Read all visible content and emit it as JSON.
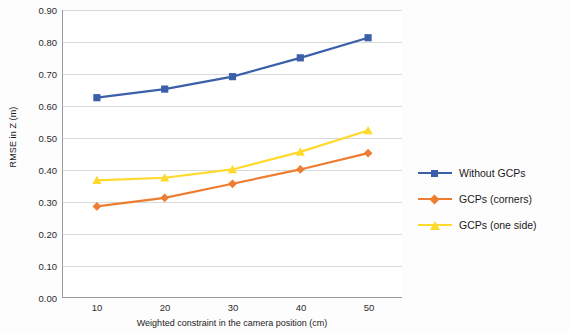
{
  "chart_data": {
    "type": "line",
    "title": "",
    "xlabel": "Weighted constraint in the camera position (cm)",
    "ylabel": "RMSE in Z (m)",
    "x": [
      10,
      20,
      30,
      40,
      50
    ],
    "xticklabels": [
      "10",
      "20",
      "30",
      "40",
      "50"
    ],
    "xlim": [
      5,
      55
    ],
    "ylim": [
      0.0,
      0.9
    ],
    "yticks": [
      0.0,
      0.1,
      0.2,
      0.3,
      0.4,
      0.5,
      0.6,
      0.7,
      0.8,
      0.9
    ],
    "yticklabels": [
      "0.00",
      "0.10",
      "0.20",
      "0.30",
      "0.40",
      "0.50",
      "0.60",
      "0.70",
      "0.80",
      "0.90"
    ],
    "grid": "horizontal",
    "legend_position": "right",
    "series": [
      {
        "name": "Without GCPs",
        "color": "#3b5fa8",
        "marker": "square",
        "values": [
          0.625,
          0.652,
          0.691,
          0.75,
          0.813
        ]
      },
      {
        "name": "GCPs (corners)",
        "color": "#ed7d31",
        "marker": "diamond",
        "values": [
          0.284,
          0.311,
          0.355,
          0.4,
          0.451
        ]
      },
      {
        "name": "GCPs (one side)",
        "color": "#ffd92b",
        "marker": "triangle",
        "values": [
          0.366,
          0.374,
          0.4,
          0.455,
          0.522
        ]
      }
    ]
  },
  "legend": {
    "items": [
      {
        "label": "Without GCPs"
      },
      {
        "label": "GCPs (corners)"
      },
      {
        "label": "GCPs (one side)"
      }
    ]
  }
}
